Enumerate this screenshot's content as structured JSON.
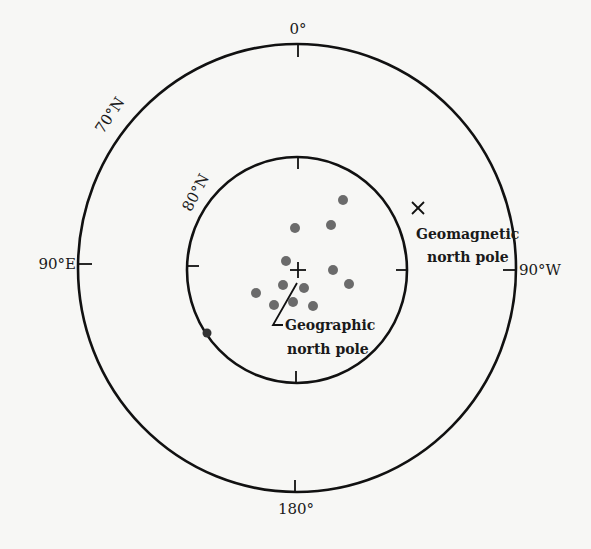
{
  "diagram": {
    "type": "polar-projection",
    "outer_circle": {
      "label": "70°N",
      "cx": 297,
      "cy": 268,
      "rx": 219,
      "ry": 224
    },
    "inner_circle": {
      "label": "80°N",
      "cx": 297,
      "cy": 270,
      "rx": 110,
      "ry": 113
    },
    "longitude_labels": {
      "top": "0°",
      "bottom": "180°",
      "left": "90°E",
      "right": "90°W"
    },
    "geographic_pole": {
      "marker": "plus",
      "x": 298,
      "y": 270,
      "label_line1": "Geographic",
      "label_line2": "north pole"
    },
    "geomagnetic_pole": {
      "marker": "x",
      "x": 418,
      "y": 208,
      "label_line1": "Geomagnetic",
      "label_line2": "north pole"
    },
    "points_color": "#6b6b6b",
    "points": [
      {
        "x": 343,
        "y": 200
      },
      {
        "x": 295,
        "y": 228
      },
      {
        "x": 331,
        "y": 225
      },
      {
        "x": 286,
        "y": 261
      },
      {
        "x": 333,
        "y": 270
      },
      {
        "x": 349,
        "y": 284
      },
      {
        "x": 283,
        "y": 285
      },
      {
        "x": 304,
        "y": 288
      },
      {
        "x": 256,
        "y": 293
      },
      {
        "x": 293,
        "y": 302
      },
      {
        "x": 274,
        "y": 305
      },
      {
        "x": 313,
        "y": 306
      },
      {
        "x": 207,
        "y": 333
      }
    ]
  }
}
